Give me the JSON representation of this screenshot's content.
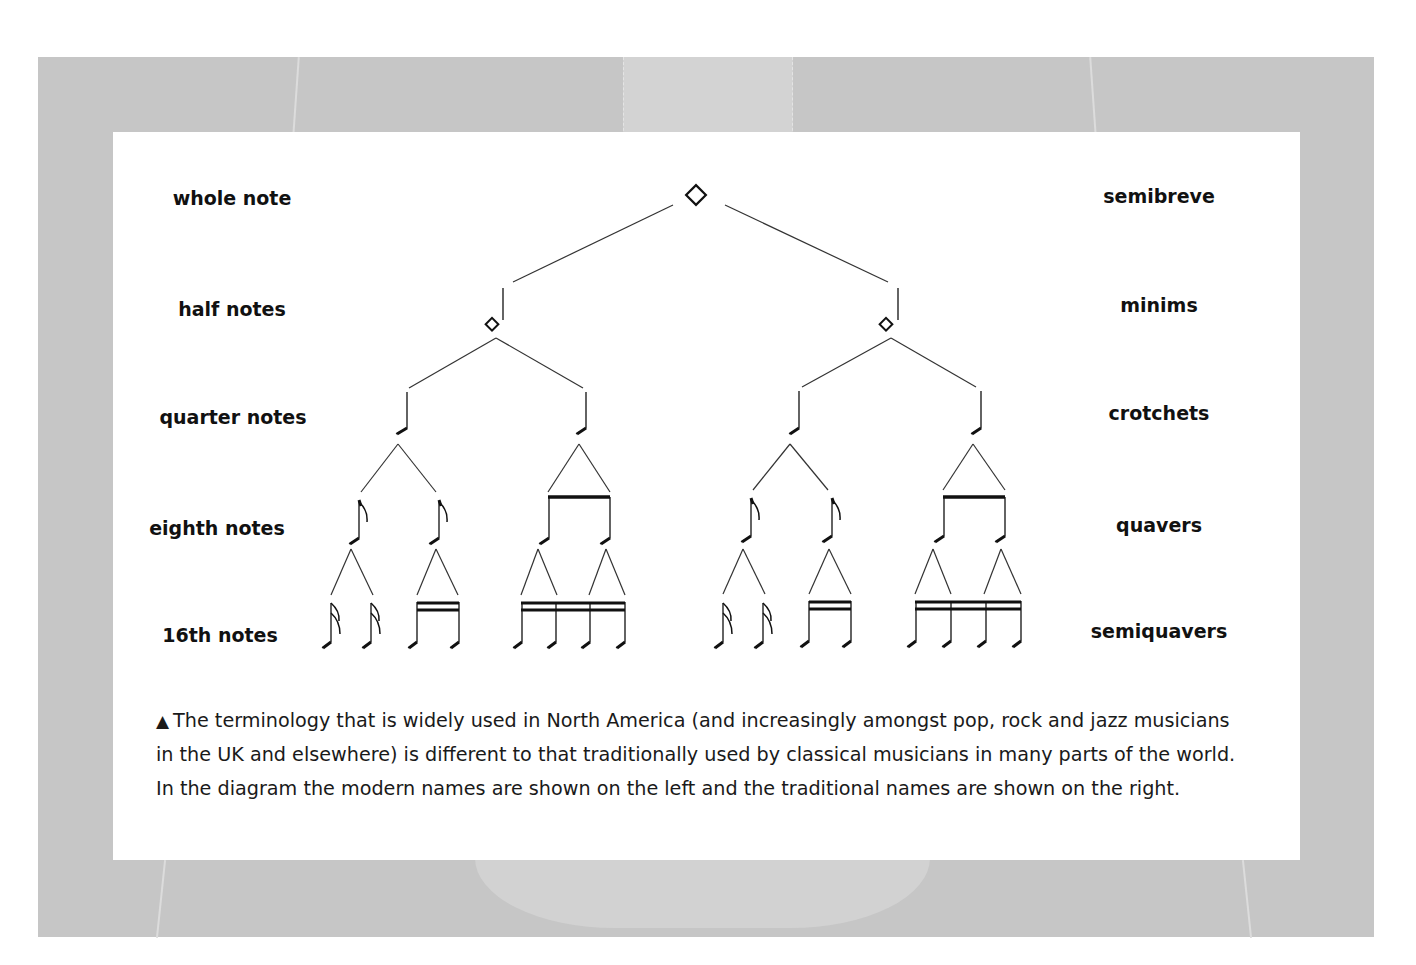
{
  "diagram": {
    "rows": [
      {
        "level": 1,
        "left_label": "whole note",
        "right_label": "semibreve",
        "count": 1
      },
      {
        "level": 2,
        "left_label": "half notes",
        "right_label": "minims",
        "count": 2
      },
      {
        "level": 3,
        "left_label": "quarter notes",
        "right_label": "crotchets",
        "count": 4
      },
      {
        "level": 4,
        "left_label": "eighth notes",
        "right_label": "quavers",
        "count": 8
      },
      {
        "level": 5,
        "left_label": "16th notes",
        "right_label": "semiquavers",
        "count": 16
      }
    ],
    "caption": {
      "marker_icon": "triangle-up-icon",
      "marker": "▲",
      "lines": [
        "The terminology that is widely used in North America (and increasingly amongst pop, rock and jazz musicians",
        "in the UK and elsewhere) is different to that traditionally used by classical musicians in many parts of the world.",
        "In the diagram the modern names are shown on the left and the traditional names are shown on the right."
      ]
    }
  },
  "colors": {
    "background": "#c6c6c6",
    "card": "#ffffff",
    "ink": "#111111"
  }
}
